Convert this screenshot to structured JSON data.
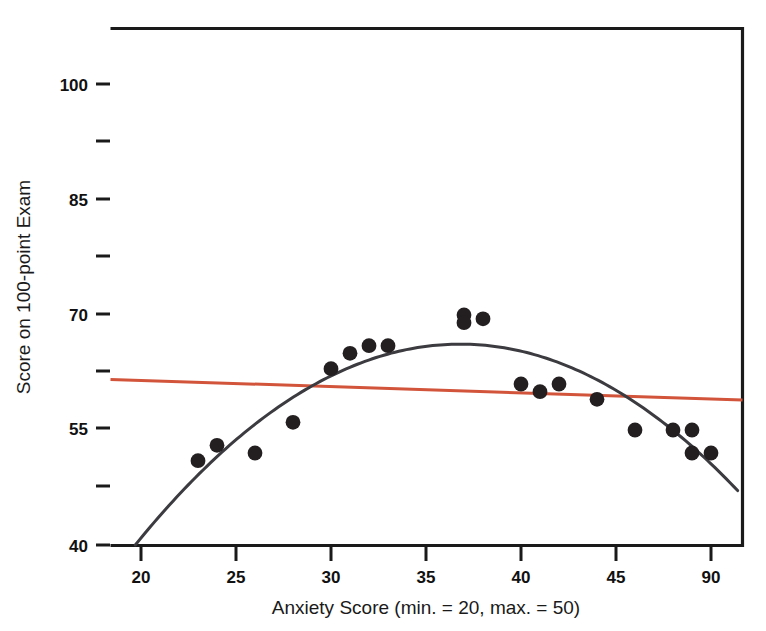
{
  "chart_data": {
    "type": "scatter",
    "title": "",
    "xlabel": "Anxiety Score (min. = 20, max. = 50)",
    "ylabel": "Score on 100-point Exam",
    "xlim": [
      18.4,
      51.7
    ],
    "ylim": [
      38.6,
      105.5
    ],
    "grid": false,
    "legend": "none",
    "x_major_ticks": [
      20,
      25,
      30,
      35,
      40,
      45,
      50
    ],
    "x_tick_labels": [
      "20",
      "25",
      "30",
      "35",
      "40",
      "45",
      "90"
    ],
    "y_major_ticks": [
      40,
      55,
      70,
      85,
      100
    ],
    "y_tick_labels": [
      "40",
      "55",
      "70",
      "85",
      "100"
    ],
    "y_minor_ticks": [
      47.5,
      62.5,
      77.5,
      92.5
    ],
    "x": [
      23,
      24,
      26,
      28,
      30,
      31,
      32,
      33,
      37,
      37,
      38,
      40,
      41,
      42,
      44,
      46,
      48,
      49,
      49,
      50
    ],
    "y": [
      51,
      53,
      52,
      56,
      63,
      65,
      66,
      66,
      70,
      69,
      69.5,
      61,
      60,
      61,
      59,
      55,
      55,
      55,
      52,
      52
    ],
    "series": [
      {
        "name": "Observed scores",
        "marker": "filled-circle",
        "color": "#231f20",
        "points": [
          [
            23,
            51
          ],
          [
            24,
            53
          ],
          [
            26,
            52
          ],
          [
            28,
            56
          ],
          [
            30,
            63
          ],
          [
            31,
            65
          ],
          [
            32,
            66
          ],
          [
            33,
            66
          ],
          [
            37,
            70
          ],
          [
            37,
            69
          ],
          [
            38,
            69.5
          ],
          [
            40,
            61
          ],
          [
            41,
            60
          ],
          [
            42,
            61
          ],
          [
            44,
            59
          ],
          [
            46,
            55
          ],
          [
            48,
            55
          ],
          [
            49,
            55
          ],
          [
            49,
            52
          ],
          [
            50,
            52
          ]
        ]
      }
    ],
    "fits": [
      {
        "name": "Quadratic fit",
        "type": "quadratic",
        "color": "#3b3b40",
        "vertex": [
          36.8,
          66.2
        ],
        "x_range": [
          19.7,
          51.4
        ],
        "coefficients": {
          "a": -0.104,
          "b": 7.654,
          "c": -74.6
        }
      },
      {
        "name": "Linear regression",
        "type": "linear",
        "color": "#d2543a",
        "x_range": [
          18.4,
          51.7
        ],
        "y_at_xmin": 61.6,
        "y_at_xmax": 58.9,
        "slope": -0.081,
        "intercept": 63.1
      }
    ]
  },
  "figure": {
    "background": "#ffffff",
    "frame_color": "#1a1a1a",
    "accent_color": "#d2543a",
    "point_color": "#231f20"
  }
}
